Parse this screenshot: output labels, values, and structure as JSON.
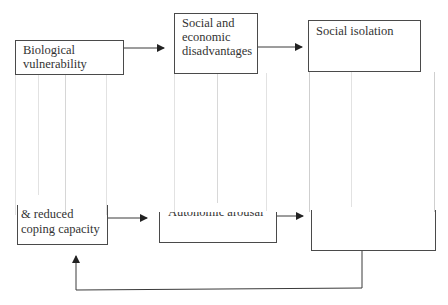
{
  "diagram": {
    "boxes": [
      {
        "id": "biological-vulnerability",
        "lines": [
          "Biological",
          "vulnerability"
        ]
      },
      {
        "id": "social-economic-disadvantages",
        "lines": [
          "Social and",
          "economic",
          "disadvantages"
        ]
      },
      {
        "id": "social-isolation",
        "lines": [
          "Social isolation"
        ]
      },
      {
        "id": "reduced-coping-capacity",
        "lines": [
          "& reduced",
          "coping capacity"
        ]
      },
      {
        "id": "autonomic-arousal",
        "lines": [
          "Autonomic arousal"
        ]
      },
      {
        "id": "lower-right-box",
        "lines": []
      }
    ],
    "arrows": [
      {
        "from": "biological-vulnerability",
        "to": "social-economic-disadvantages"
      },
      {
        "from": "social-economic-disadvantages",
        "to": "social-isolation"
      },
      {
        "from": "reduced-coping-capacity",
        "to": "autonomic-arousal"
      },
      {
        "from": "autonomic-arousal",
        "to": "lower-right-box"
      },
      {
        "from": "lower-right-box",
        "to": "reduced-coping-capacity",
        "type": "feedback-loop"
      }
    ],
    "colors": {
      "line": "#4a4a4a",
      "faint_line": "#e2e2e2",
      "background": "#ffffff"
    }
  }
}
